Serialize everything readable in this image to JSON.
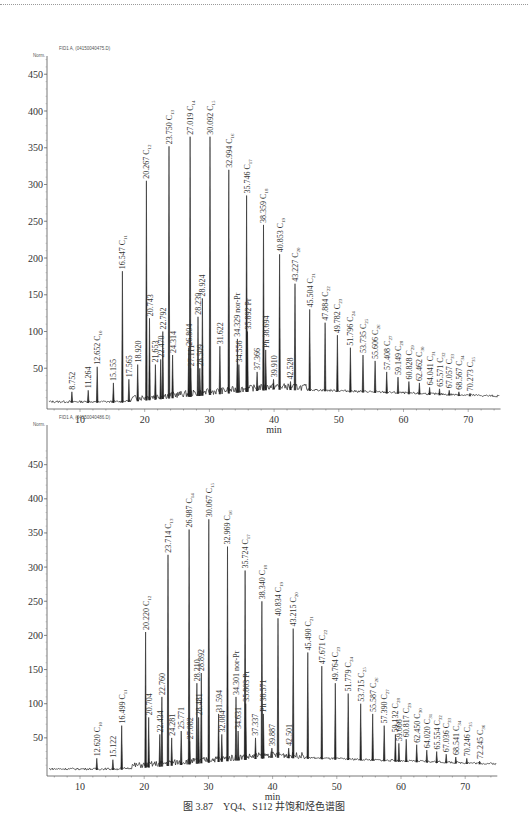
{
  "caption": "图 3.87　YQ4、S112 井饱和烃色谱图",
  "chart_data": [
    {
      "type": "line",
      "title": "YQ4",
      "header": "FID1 A, (04150040475.D)",
      "y_unit": "Norm.",
      "xlabel": "min",
      "ylabel": "Norm.",
      "xlim": [
        5,
        75
      ],
      "ylim": [
        0,
        480
      ],
      "x_ticks": [
        10,
        20,
        30,
        40,
        50,
        60,
        70
      ],
      "y_ticks": [
        50,
        100,
        150,
        200,
        250,
        300,
        350,
        400,
        450
      ],
      "grid": false,
      "geom": {
        "x0": 47,
        "x10": 80,
        "pxPerMin": 6.47,
        "y0": 405,
        "pxPerUnit": 0.735,
        "top": 56
      },
      "peaks": [
        {
          "t": 8.752,
          "h": 18,
          "label": "8.752"
        },
        {
          "t": 11.264,
          "h": 20,
          "label": "11.264"
        },
        {
          "t": 12.652,
          "h": 52,
          "label": "12.652",
          "c": "10"
        },
        {
          "t": 15.155,
          "h": 30,
          "label": "15.155"
        },
        {
          "t": 16.547,
          "h": 182,
          "label": "16.547",
          "c": "11"
        },
        {
          "t": 17.565,
          "h": 35,
          "label": "17.565"
        },
        {
          "t": 18.92,
          "h": 55,
          "label": "18.920"
        },
        {
          "t": 20.267,
          "h": 305,
          "label": "20.267",
          "c": "12"
        },
        {
          "t": 20.743,
          "h": 118,
          "label": "20.743"
        },
        {
          "t": 21.653,
          "h": 55,
          "label": "21.653"
        },
        {
          "t": 22.47,
          "h": 62,
          "label": "22.470"
        },
        {
          "t": 22.792,
          "h": 100,
          "label": "22.792"
        },
        {
          "t": 23.75,
          "h": 352,
          "label": "23.750",
          "c": "13"
        },
        {
          "t": 24.314,
          "h": 68,
          "label": "24.314"
        },
        {
          "t": 26.804,
          "h": 78,
          "label": "26.804"
        },
        {
          "t": 27.019,
          "h": 365,
          "label": "27.019",
          "c": "14"
        },
        {
          "t": 27.111,
          "h": 50,
          "label": "27.111"
        },
        {
          "t": 28.239,
          "h": 120,
          "label": "28.239"
        },
        {
          "t": 28.509,
          "h": 50,
          "label": "28.509"
        },
        {
          "t": 28.924,
          "h": 145,
          "label": "28.924"
        },
        {
          "t": 30.092,
          "h": 365,
          "label": "30.092",
          "c": "15"
        },
        {
          "t": 31.622,
          "h": 80,
          "label": "31.622"
        },
        {
          "t": 32.994,
          "h": 320,
          "label": "32.994",
          "c": "16"
        },
        {
          "t": 34.329,
          "h": 90,
          "label": "34.329 nor-Pr"
        },
        {
          "t": 34.556,
          "h": 55,
          "label": "34.556"
        },
        {
          "t": 35.746,
          "h": 285,
          "label": "35.746",
          "c": "17"
        },
        {
          "t": 35.892,
          "h": 100,
          "label": "35.892 Pr"
        },
        {
          "t": 37.366,
          "h": 45,
          "label": "37.366"
        },
        {
          "t": 38.359,
          "h": 245,
          "label": "38.359",
          "c": "18"
        },
        {
          "t": 38.694,
          "h": 75,
          "label": "Ph 38.694"
        },
        {
          "t": 39.91,
          "h": 35,
          "label": "39.910"
        },
        {
          "t": 40.853,
          "h": 205,
          "label": "40.853",
          "c": "19"
        },
        {
          "t": 42.528,
          "h": 32,
          "label": "42.528"
        },
        {
          "t": 43.227,
          "h": 165,
          "label": "43.227",
          "c": "20"
        },
        {
          "t": 45.504,
          "h": 130,
          "label": "45.504",
          "c": "21"
        },
        {
          "t": 47.884,
          "h": 112,
          "label": "47.884",
          "c": "22"
        },
        {
          "t": 49.782,
          "h": 95,
          "label": "49.782",
          "c": "23"
        },
        {
          "t": 51.796,
          "h": 78,
          "label": "51.796",
          "c": "24"
        },
        {
          "t": 53.735,
          "h": 68,
          "label": "53.735",
          "c": "25"
        },
        {
          "t": 55.606,
          "h": 60,
          "label": "55.606",
          "c": "26"
        },
        {
          "t": 57.408,
          "h": 45,
          "label": "57.408",
          "c": "27"
        },
        {
          "t": 59.149,
          "h": 38,
          "label": "59.149",
          "c": "28"
        },
        {
          "t": 60.828,
          "h": 32,
          "label": "60.828",
          "c": "29"
        },
        {
          "t": 62.462,
          "h": 30,
          "label": "62.462",
          "c": "30"
        },
        {
          "t": 64.041,
          "h": 24,
          "label": "64.041",
          "c": "31"
        },
        {
          "t": 65.571,
          "h": 22,
          "label": "65.571",
          "c": "32"
        },
        {
          "t": 67.057,
          "h": 20,
          "label": "67.057",
          "c": "33"
        },
        {
          "t": 68.567,
          "h": 18,
          "label": "68.567",
          "c": "34"
        },
        {
          "t": 70.273,
          "h": 16,
          "label": "70.273",
          "c": "35"
        }
      ]
    },
    {
      "type": "line",
      "title": "S112",
      "header": "FID1 A, (04150040486.D)",
      "y_unit": "Norm.",
      "xlabel": "min",
      "ylabel": "Norm.",
      "xlim": [
        5,
        75
      ],
      "ylim": [
        0,
        480
      ],
      "x_ticks": [
        10,
        20,
        30,
        40,
        50,
        60,
        70
      ],
      "y_ticks": [
        50,
        100,
        150,
        200,
        250,
        300,
        350,
        400,
        450
      ],
      "grid": false,
      "geom": {
        "x0": 47,
        "x10": 80,
        "pxPerMin": 6.42,
        "y0": 772,
        "pxPerUnit": 0.683,
        "top": 425
      },
      "peaks": [
        {
          "t": 12.62,
          "h": 20,
          "label": "12.620",
          "c": "10"
        },
        {
          "t": 15.122,
          "h": 18,
          "label": "15.122"
        },
        {
          "t": 16.499,
          "h": 68,
          "label": "16.499",
          "c": "11"
        },
        {
          "t": 20.22,
          "h": 205,
          "label": "20.220",
          "c": "12"
        },
        {
          "t": 20.704,
          "h": 80,
          "label": "20.704"
        },
        {
          "t": 22.434,
          "h": 55,
          "label": "22.434"
        },
        {
          "t": 22.76,
          "h": 110,
          "label": "22.760"
        },
        {
          "t": 23.714,
          "h": 318,
          "label": "23.714",
          "c": "13"
        },
        {
          "t": 24.281,
          "h": 50,
          "label": "24.281"
        },
        {
          "t": 25.771,
          "h": 60,
          "label": "25.771"
        },
        {
          "t": 26.987,
          "h": 355,
          "label": "26.987",
          "c": "14"
        },
        {
          "t": 27.082,
          "h": 45,
          "label": "27.082"
        },
        {
          "t": 28.21,
          "h": 130,
          "label": "28.210"
        },
        {
          "t": 28.481,
          "h": 80,
          "label": "28.481"
        },
        {
          "t": 28.892,
          "h": 145,
          "label": "28.892"
        },
        {
          "t": 30.067,
          "h": 370,
          "label": "30.067",
          "c": "15"
        },
        {
          "t": 31.594,
          "h": 85,
          "label": "31.594"
        },
        {
          "t": 32.084,
          "h": 55,
          "label": "32.084"
        },
        {
          "t": 32.969,
          "h": 330,
          "label": "32.969",
          "c": "16"
        },
        {
          "t": 34.301,
          "h": 110,
          "label": "34.301 nor-Pr"
        },
        {
          "t": 34.631,
          "h": 60,
          "label": "34.631"
        },
        {
          "t": 35.724,
          "h": 295,
          "label": "35.724",
          "c": "17"
        },
        {
          "t": 35.803,
          "h": 100,
          "label": "35.803 Pr"
        },
        {
          "t": 37.337,
          "h": 50,
          "label": "37.337"
        },
        {
          "t": 38.34,
          "h": 250,
          "label": "38.340",
          "c": "18"
        },
        {
          "t": 38.571,
          "h": 85,
          "label": "Ph 38.571"
        },
        {
          "t": 39.887,
          "h": 35,
          "label": "39.887"
        },
        {
          "t": 40.834,
          "h": 225,
          "label": "40.834",
          "c": "19"
        },
        {
          "t": 42.501,
          "h": 35,
          "label": "42.501"
        },
        {
          "t": 43.215,
          "h": 210,
          "label": "43.215",
          "c": "20"
        },
        {
          "t": 45.49,
          "h": 175,
          "label": "45.490",
          "c": "21"
        },
        {
          "t": 47.671,
          "h": 155,
          "label": "47.671",
          "c": "22"
        },
        {
          "t": 49.764,
          "h": 130,
          "label": "49.764",
          "c": "23"
        },
        {
          "t": 51.779,
          "h": 115,
          "label": "51.779",
          "c": "24"
        },
        {
          "t": 53.715,
          "h": 100,
          "label": "53.715",
          "c": "25"
        },
        {
          "t": 55.587,
          "h": 85,
          "label": "55.587",
          "c": "26"
        },
        {
          "t": 57.39,
          "h": 68,
          "label": "57.390",
          "c": "27"
        },
        {
          "t": 59.132,
          "h": 55,
          "label": "59.132",
          "c": "28"
        },
        {
          "t": 59.666,
          "h": 42,
          "label": "59.666"
        },
        {
          "t": 60.817,
          "h": 48,
          "label": "60.817",
          "c": "29"
        },
        {
          "t": 62.45,
          "h": 40,
          "label": "62.450",
          "c": "30"
        },
        {
          "t": 64.02,
          "h": 32,
          "label": "64.020",
          "c": "31"
        },
        {
          "t": 65.554,
          "h": 30,
          "label": "65.554",
          "c": "32"
        },
        {
          "t": 67.036,
          "h": 26,
          "label": "67.036",
          "c": "33"
        },
        {
          "t": 68.541,
          "h": 22,
          "label": "68.541",
          "c": "34"
        },
        {
          "t": 70.246,
          "h": 20,
          "label": "70.246",
          "c": "35"
        },
        {
          "t": 72.245,
          "h": 16,
          "label": "72.245",
          "c": "36"
        }
      ]
    }
  ]
}
